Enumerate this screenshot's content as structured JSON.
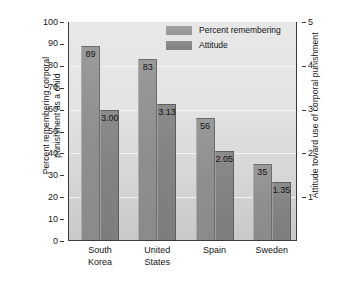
{
  "chart_data": {
    "type": "bar",
    "title": "",
    "subtitle": "",
    "categories": [
      "South\nKorea",
      "United\nStates",
      "Spain",
      "Sweden"
    ],
    "series": [
      {
        "name": "Percent remembering",
        "axis": "left",
        "values": [
          89,
          83,
          56,
          35
        ],
        "labels": [
          "89",
          "83",
          "56",
          "35"
        ],
        "color": "#8f8f8f"
      },
      {
        "name": "Attitude",
        "axis": "right",
        "values": [
          3.0,
          3.13,
          2.05,
          1.35
        ],
        "labels": [
          "3.00",
          "3.13",
          "2.05",
          "1.35"
        ],
        "color": "#828282"
      }
    ],
    "xlabel": "",
    "ylabel": "Percent remembering corporal\npunishment as a child",
    "ylabel_right": "Attitude toward use of corporal punishment",
    "ylim": [
      0,
      100
    ],
    "ylim_right": [
      0,
      5
    ],
    "yticks": [
      "100",
      "90",
      "80",
      "70",
      "60",
      "50",
      "40",
      "30",
      "20",
      "10",
      "0"
    ],
    "yticks_right": [
      "5",
      "4",
      "3",
      "2",
      "1"
    ],
    "grid": true,
    "gridlines_at": [
      80,
      60,
      40,
      20
    ],
    "legend_position": "top-center",
    "legend": [
      "Percent remembering",
      "Attitude"
    ],
    "plot_background": "#e3e3e3"
  },
  "axes": {
    "left_title": "Percent remembering corporal\npunishment as a child",
    "right_title": "Attitude toward use of corporal punishment"
  },
  "legend": {
    "items": [
      {
        "label": "Percent remembering",
        "swatch": "percent-swatch"
      },
      {
        "label": "Attitude",
        "swatch": "attitude-swatch"
      }
    ]
  },
  "ticks": {
    "left": [
      "100",
      "90",
      "80",
      "70",
      "60",
      "50",
      "40",
      "30",
      "20",
      "10",
      "0"
    ],
    "right": [
      "5",
      "4",
      "3",
      "2",
      "1"
    ]
  },
  "categories": [
    "South\nKorea",
    "United\nStates",
    "Spain",
    "Sweden"
  ],
  "values": {
    "percent": [
      "89",
      "83",
      "56",
      "35"
    ],
    "attitude": [
      "3.00",
      "3.13",
      "2.05",
      "1.35"
    ]
  }
}
